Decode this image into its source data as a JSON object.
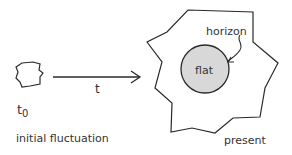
{
  "diagram": {
    "left": {
      "time_label": "t",
      "time_subscript": "0",
      "caption": "initial fluctuation"
    },
    "arrow": {
      "label": "t"
    },
    "right": {
      "horizon_label": "horizon",
      "region_label": "flat",
      "caption": "present"
    },
    "colors": {
      "stroke": "#2a2a2a",
      "flat_fill": "#d8d8d8",
      "text": "#333333"
    }
  }
}
